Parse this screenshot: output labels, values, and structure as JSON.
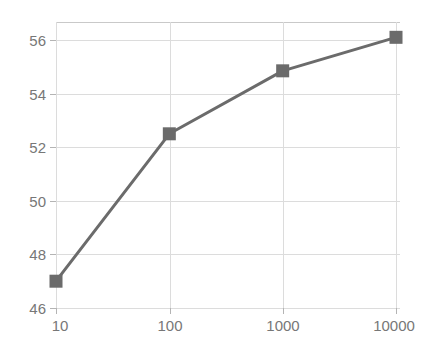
{
  "chart_data": {
    "type": "line",
    "title": "",
    "subtitle": "",
    "xlabel": "",
    "ylabel": "",
    "xscale": "log",
    "yscale": "linear",
    "x": [
      10,
      100,
      1000,
      10000
    ],
    "values": [
      47.0,
      52.5,
      54.85,
      56.1
    ],
    "series": [
      {
        "name": "series-1",
        "x": [
          10,
          100,
          1000,
          10000
        ],
        "values": [
          47.0,
          52.5,
          54.85,
          56.1
        ],
        "color": "#6b6b6b",
        "marker": "square"
      }
    ],
    "x_tick_labels": [
      "10",
      "100",
      "1000",
      "10000"
    ],
    "x_tick_values": [
      10,
      100,
      1000,
      10000
    ],
    "y_tick_labels": [
      "46",
      "48",
      "50",
      "52",
      "54",
      "56"
    ],
    "y_tick_values": [
      46,
      48,
      50,
      52,
      54,
      56
    ],
    "xlim": [
      10,
      10000
    ],
    "ylim": [
      46,
      56.9
    ],
    "grid": true,
    "grid_axis": "both",
    "legend": false,
    "legend_position": "none"
  },
  "style": {
    "line_color": "#6b6b6b",
    "marker_color": "#6b6b6b",
    "grid_color": "#dcdcdc",
    "axis_color": "#c9c9c9",
    "tick_label_color": "#777777",
    "background": "#ffffff"
  }
}
